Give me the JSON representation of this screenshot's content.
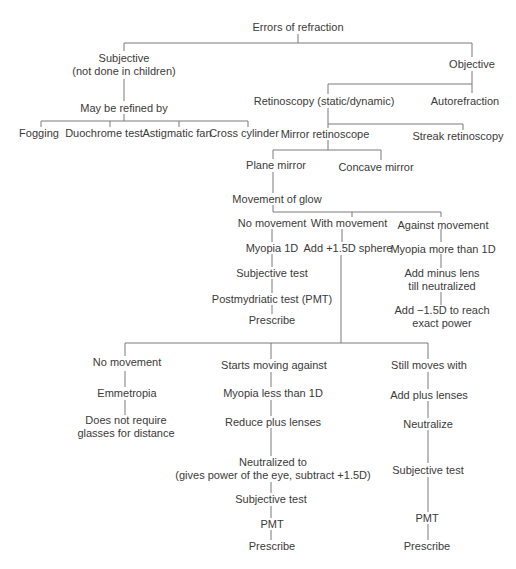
{
  "diagram": {
    "title": "Errors of refraction",
    "nodes": {
      "root": "Errors of refraction",
      "subjective": [
        "Subjective",
        "(not done in children)"
      ],
      "objective": "Objective",
      "may_be_refined": "May be refined by",
      "fogging": "Fogging",
      "duochrome": "Duochrome test",
      "astigmatic_fan": "Astigmatic fan",
      "cross_cylinder": "Cross cylinder",
      "retinoscopy": "Retinoscopy (static/dynamic)",
      "autorefraction": "Autorefraction",
      "mirror_retinoscope": "Mirror retinoscope",
      "streak_retinoscopy": "Streak retinoscopy",
      "plane_mirror": "Plane mirror",
      "concave_mirror": "Concave mirror",
      "movement_of_glow": "Movement of glow",
      "no_movement_1": "No movement",
      "with_movement": "With movement",
      "against_movement": "Against movement",
      "myopia_1d": "Myopia 1D",
      "subjective_test_1": "Subjective test",
      "pmt_full": "Postmydriatic test (PMT)",
      "prescribe_1": "Prescribe",
      "add_plus_sphere": "Add +1.5D sphere",
      "myopia_more_1d": "Myopia more than 1D",
      "add_minus_lens": [
        "Add minus lens",
        "till neutralized"
      ],
      "add_minus_15": [
        "Add −1.5D to reach",
        "exact power"
      ],
      "no_movement_2": "No movement",
      "emmetropia": "Emmetropia",
      "no_glasses": [
        "Does not require",
        "glasses for distance"
      ],
      "starts_moving_against": "Starts moving against",
      "myopia_less_1d": "Myopia less than 1D",
      "reduce_plus": "Reduce plus lenses",
      "neutralized_to": [
        "Neutralized to",
        "(gives power of the eye, subtract +1.5D)"
      ],
      "subjective_test_2": "Subjective test",
      "pmt_2": "PMT",
      "prescribe_2": "Prescribe",
      "still_moves_with": "Still moves with",
      "add_plus_lenses": "Add plus lenses",
      "neutralize": "Neutralize",
      "subjective_test_3": "Subjective test",
      "pmt_3": "PMT",
      "prescribe_3": "Prescribe"
    },
    "colors": {
      "line": "#7a7a7a",
      "text": "#3a3a3a",
      "background": "#ffffff"
    }
  }
}
